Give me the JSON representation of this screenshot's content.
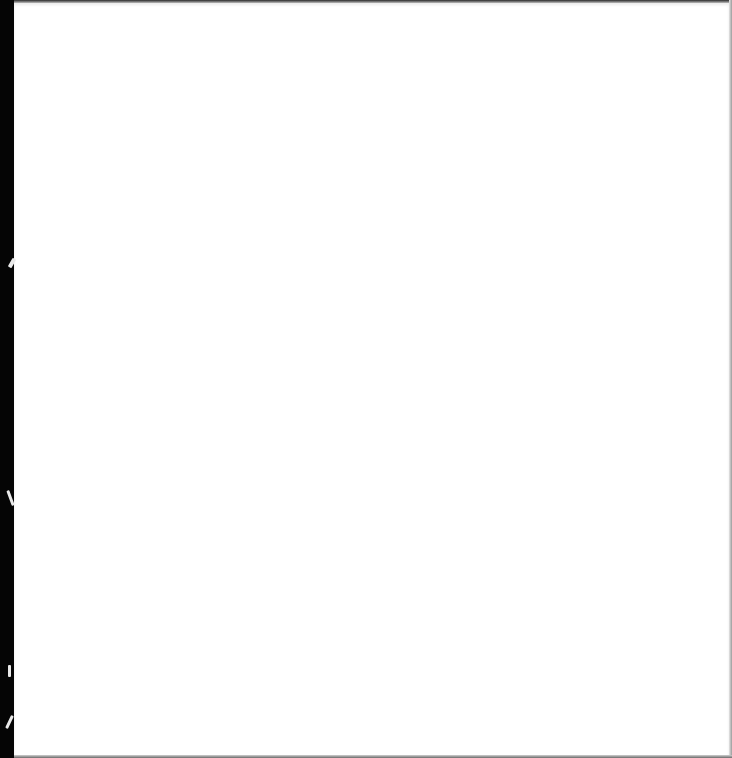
{
  "document": {
    "type": "scanned-page",
    "content": "",
    "colors": {
      "paper": "#ffffff",
      "scan_edge": "#000000",
      "border": "#9a9a9a"
    }
  }
}
